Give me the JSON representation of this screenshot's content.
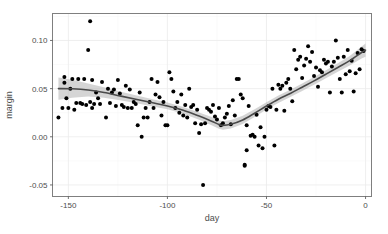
{
  "chart_data": {
    "type": "scatter",
    "title": "",
    "xlabel": "day",
    "ylabel": "margin",
    "xlim": [
      -158,
      3
    ],
    "ylim": [
      -0.062,
      0.128
    ],
    "xticks": [
      -150,
      -100,
      -50,
      0
    ],
    "xticklabels": [
      "-150",
      "-100",
      "-50",
      "0"
    ],
    "yticks": [
      -0.05,
      0.0,
      0.05,
      0.1
    ],
    "yticklabels": [
      "-0.05",
      "0.00",
      "0.05",
      "0.10"
    ],
    "grid": true,
    "legend": "none",
    "point_color": "#000000",
    "line_color": "#4a4a4a",
    "ribbon_color": "#b3b3b3",
    "panel_background": "#ffffff",
    "gridline_color": "#ebebeb",
    "series": [
      {
        "name": "observations",
        "type": "scatter",
        "x": [
          -155,
          -153,
          -152,
          -152,
          -151,
          -150,
          -149,
          -148,
          -147,
          -146,
          -145,
          -144,
          -143,
          -142,
          -141,
          -140,
          -139,
          -139,
          -138,
          -138,
          -137,
          -136,
          -135,
          -134,
          -133,
          -131,
          -130,
          -129,
          -128,
          -127,
          -126,
          -125,
          -124,
          -123,
          -122,
          -121,
          -120,
          -119,
          -118,
          -117,
          -116,
          -115,
          -114,
          -113,
          -112,
          -111,
          -110,
          -109,
          -108,
          -107,
          -106,
          -105,
          -104,
          -103,
          -102,
          -101,
          -100,
          -99,
          -98,
          -97,
          -96,
          -95,
          -94,
          -93,
          -92,
          -91,
          -90,
          -89,
          -88,
          -87,
          -86,
          -85,
          -84,
          -83,
          -82,
          -81,
          -80,
          -79,
          -78,
          -77,
          -76,
          -75,
          -74,
          -73,
          -72,
          -71,
          -70,
          -69,
          -68,
          -67,
          -66,
          -65,
          -64,
          -63,
          -62,
          -61,
          -61,
          -60,
          -60,
          -59,
          -58,
          -57,
          -56,
          -55,
          -54,
          -53,
          -52,
          -51,
          -50,
          -49,
          -48,
          -47,
          -46,
          -45,
          -44,
          -43,
          -42,
          -41,
          -40,
          -39,
          -38,
          -37,
          -36,
          -35,
          -34,
          -33,
          -32,
          -31,
          -30,
          -29,
          -28,
          -27,
          -26,
          -25,
          -24,
          -23,
          -22,
          -21,
          -20,
          -19,
          -18,
          -17,
          -16,
          -15,
          -14,
          -13,
          -12,
          -11,
          -10,
          -9,
          -8,
          -7,
          -6,
          -5,
          -4,
          -3,
          -2,
          -1
        ],
        "y": [
          0.02,
          0.03,
          0.062,
          0.056,
          0.04,
          0.03,
          0.05,
          0.06,
          0.028,
          0.035,
          0.06,
          0.035,
          0.034,
          0.06,
          0.033,
          0.09,
          0.12,
          0.036,
          0.059,
          0.03,
          0.034,
          0.046,
          0.04,
          0.034,
          0.057,
          0.02,
          0.05,
          0.035,
          0.046,
          0.049,
          0.032,
          0.059,
          0.045,
          0.033,
          0.031,
          0.053,
          0.03,
          0.049,
          0.03,
          0.036,
          0.034,
          0.012,
          0.046,
          0.0,
          0.02,
          0.03,
          0.02,
          0.036,
          0.06,
          0.03,
          0.044,
          0.057,
          0.041,
          0.022,
          0.036,
          0.012,
          0.012,
          0.067,
          0.06,
          0.047,
          0.03,
          0.036,
          0.025,
          0.044,
          0.022,
          0.033,
          0.02,
          0.05,
          0.031,
          0.033,
          0.014,
          0.028,
          0.004,
          0.013,
          -0.05,
          0.014,
          0.03,
          0.028,
          0.026,
          0.033,
          0.021,
          0.018,
          0.03,
          0.012,
          0.014,
          0.02,
          0.024,
          0.032,
          0.013,
          0.038,
          0.022,
          0.06,
          0.06,
          0.044,
          0.04,
          -0.029,
          -0.03,
          0.012,
          -0.014,
          0.032,
          0.001,
          0.002,
          0.0,
          0.023,
          -0.009,
          0.01,
          -0.012,
          0.0,
          0.028,
          0.032,
          0.031,
          0.05,
          -0.009,
          0.028,
          0.054,
          0.05,
          0.053,
          0.027,
          0.056,
          0.06,
          0.05,
          0.037,
          0.09,
          0.07,
          0.08,
          0.083,
          0.061,
          0.074,
          0.081,
          0.094,
          0.078,
          0.088,
          0.063,
          0.072,
          0.052,
          0.069,
          0.067,
          0.08,
          0.076,
          0.078,
          0.046,
          0.073,
          0.078,
          0.1,
          0.082,
          0.06,
          0.046,
          0.083,
          0.065,
          0.09,
          0.068,
          0.079,
          0.047,
          0.066,
          0.087,
          0.07,
          0.091,
          0.089
        ]
      },
      {
        "name": "loess-fit",
        "type": "line",
        "x": [
          -155,
          -148,
          -140,
          -132,
          -124,
          -116,
          -108,
          -100,
          -92,
          -84,
          -78,
          -74,
          -72,
          -68,
          -62,
          -56,
          -50,
          -44,
          -38,
          -32,
          -26,
          -20,
          -14,
          -8,
          -2,
          0
        ],
        "y": [
          0.05,
          0.0498,
          0.0485,
          0.046,
          0.0425,
          0.039,
          0.0355,
          0.032,
          0.0275,
          0.0215,
          0.0165,
          0.0128,
          0.0118,
          0.013,
          0.0175,
          0.0245,
          0.032,
          0.039,
          0.045,
          0.0515,
          0.058,
          0.065,
          0.072,
          0.079,
          0.0875,
          0.09
        ],
        "ci_lower": [
          0.0385,
          0.0405,
          0.0418,
          0.0405,
          0.038,
          0.035,
          0.0318,
          0.0285,
          0.024,
          0.0178,
          0.0122,
          0.0084,
          0.0074,
          0.0087,
          0.0132,
          0.0205,
          0.0282,
          0.0352,
          0.0412,
          0.0476,
          0.054,
          0.0608,
          0.0676,
          0.074,
          0.0812,
          0.0832
        ],
        "ci_upper": [
          0.0615,
          0.0591,
          0.0552,
          0.0515,
          0.047,
          0.043,
          0.0392,
          0.0355,
          0.031,
          0.0252,
          0.0208,
          0.0172,
          0.0162,
          0.0173,
          0.0218,
          0.0285,
          0.0358,
          0.0428,
          0.0488,
          0.0554,
          0.062,
          0.0692,
          0.0764,
          0.084,
          0.0938,
          0.0968
        ]
      }
    ]
  }
}
